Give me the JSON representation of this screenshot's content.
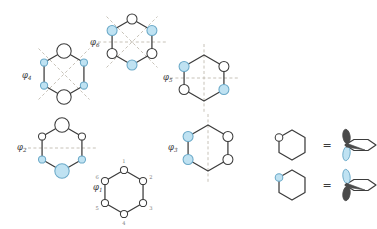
{
  "figure": {
    "background_color": "#ffffff",
    "colors": {
      "bond_stroke": "#3c3c3c",
      "lobe_white_fill": "#ffffff",
      "lobe_blue_fill": "#bfe2f2",
      "lobe_blue_stroke": "#6aa9c8",
      "node_dash": "#b9b2a6",
      "label_text": "#3a3a3a",
      "number_text": "#7a7a7a",
      "orbital_dark_fill": "#4a4a4a"
    },
    "orbitals": [
      {
        "id": "phi1",
        "label": "φ",
        "subscript": "1",
        "label_x": 93,
        "label_y": 190,
        "center_x": 124,
        "center_y": 192,
        "radius": 22,
        "nodal_planes": [],
        "vertex_numbers": [
          "1",
          "2",
          "3",
          "4",
          "5",
          "6"
        ],
        "vertices": [
          {
            "pos": "top",
            "phase": "white",
            "size": "small"
          },
          {
            "pos": "upper-right",
            "phase": "white",
            "size": "small"
          },
          {
            "pos": "lower-right",
            "phase": "white",
            "size": "small"
          },
          {
            "pos": "bottom",
            "phase": "white",
            "size": "small"
          },
          {
            "pos": "lower-left",
            "phase": "white",
            "size": "small"
          },
          {
            "pos": "upper-left",
            "phase": "white",
            "size": "small"
          }
        ]
      },
      {
        "id": "phi2",
        "label": "φ",
        "subscript": "2",
        "label_x": 17,
        "label_y": 150,
        "center_x": 62,
        "center_y": 148,
        "radius": 23,
        "nodal_planes": [
          "horizontal"
        ],
        "vertex_numbers": [],
        "vertices": [
          {
            "pos": "top",
            "phase": "white",
            "size": "large"
          },
          {
            "pos": "upper-right",
            "phase": "white",
            "size": "small"
          },
          {
            "pos": "lower-right",
            "phase": "blue",
            "size": "small"
          },
          {
            "pos": "bottom",
            "phase": "blue",
            "size": "large"
          },
          {
            "pos": "lower-left",
            "phase": "blue",
            "size": "small"
          },
          {
            "pos": "upper-left",
            "phase": "white",
            "size": "small"
          }
        ]
      },
      {
        "id": "phi3",
        "label": "φ",
        "subscript": "3",
        "label_x": 168,
        "label_y": 150,
        "center_x": 208,
        "center_y": 148,
        "radius": 23,
        "nodal_planes": [
          "vertical"
        ],
        "vertex_numbers": [],
        "vertices": [
          {
            "pos": "top",
            "phase": "none",
            "size": "none"
          },
          {
            "pos": "upper-right",
            "phase": "white",
            "size": "medium"
          },
          {
            "pos": "lower-right",
            "phase": "white",
            "size": "medium"
          },
          {
            "pos": "bottom",
            "phase": "none",
            "size": "none"
          },
          {
            "pos": "lower-left",
            "phase": "blue",
            "size": "medium"
          },
          {
            "pos": "upper-left",
            "phase": "blue",
            "size": "medium"
          }
        ]
      },
      {
        "id": "phi4",
        "label": "φ",
        "subscript": "4",
        "label_x": 22,
        "label_y": 78,
        "center_x": 64,
        "center_y": 74,
        "radius": 23,
        "nodal_planes": [
          "diagonal-up",
          "diagonal-down"
        ],
        "vertex_numbers": [],
        "vertices": [
          {
            "pos": "top",
            "phase": "white",
            "size": "large"
          },
          {
            "pos": "upper-right",
            "phase": "blue",
            "size": "small"
          },
          {
            "pos": "lower-right",
            "phase": "blue",
            "size": "small"
          },
          {
            "pos": "bottom",
            "phase": "white",
            "size": "large"
          },
          {
            "pos": "lower-left",
            "phase": "blue",
            "size": "small"
          },
          {
            "pos": "upper-left",
            "phase": "blue",
            "size": "small"
          }
        ]
      },
      {
        "id": "phi5",
        "label": "φ",
        "subscript": "5",
        "label_x": 163,
        "label_y": 80,
        "center_x": 204,
        "center_y": 78,
        "radius": 23,
        "nodal_planes": [
          "horizontal",
          "vertical"
        ],
        "vertex_numbers": [],
        "vertices": [
          {
            "pos": "top",
            "phase": "none",
            "size": "none"
          },
          {
            "pos": "upper-right",
            "phase": "white",
            "size": "medium"
          },
          {
            "pos": "lower-right",
            "phase": "blue",
            "size": "medium"
          },
          {
            "pos": "bottom",
            "phase": "none",
            "size": "none"
          },
          {
            "pos": "lower-left",
            "phase": "white",
            "size": "medium"
          },
          {
            "pos": "upper-left",
            "phase": "blue",
            "size": "medium"
          }
        ]
      },
      {
        "id": "phi6",
        "label": "φ",
        "subscript": "6",
        "label_x": 90,
        "label_y": 45,
        "center_x": 132,
        "center_y": 42,
        "radius": 23,
        "nodal_planes": [
          "horizontal",
          "diagonal-up",
          "diagonal-down"
        ],
        "vertex_numbers": [],
        "vertices": [
          {
            "pos": "top",
            "phase": "white",
            "size": "medium"
          },
          {
            "pos": "upper-right",
            "phase": "blue",
            "size": "medium"
          },
          {
            "pos": "lower-right",
            "phase": "white",
            "size": "medium"
          },
          {
            "pos": "bottom",
            "phase": "blue",
            "size": "medium"
          },
          {
            "pos": "lower-left",
            "phase": "white",
            "size": "medium"
          },
          {
            "pos": "upper-left",
            "phase": "blue",
            "size": "medium"
          }
        ]
      }
    ],
    "legend": [
      {
        "id": "legend-white-top",
        "equals": "=",
        "ring_circle_phase": "white",
        "ring_circle_pos": "upper-left",
        "orbital_top_lobe": "dark",
        "orbital_bottom_lobe": "blue",
        "hex_x": 292,
        "hex_y": 145,
        "eq_x": 327,
        "eq_y": 146,
        "orb_x": 345,
        "orb_y": 145
      },
      {
        "id": "legend-blue-top",
        "equals": "=",
        "ring_circle_phase": "blue",
        "ring_circle_pos": "upper-left",
        "orbital_top_lobe": "blue",
        "orbital_bottom_lobe": "dark",
        "hex_x": 292,
        "hex_y": 185,
        "eq_x": 327,
        "eq_y": 186,
        "orb_x": 345,
        "orb_y": 185
      }
    ]
  }
}
